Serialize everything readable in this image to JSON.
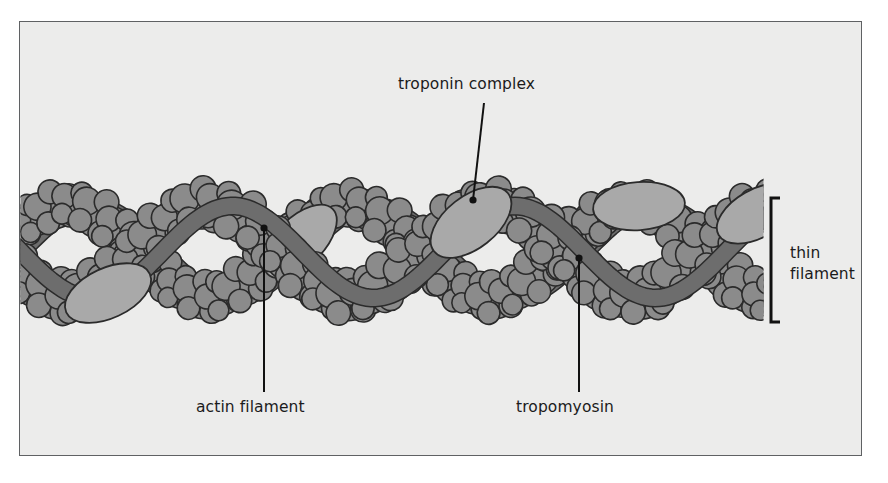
{
  "figure": {
    "kind": "biology-diagram",
    "background_color": "#ececeb",
    "frame_border_color": "#5f6163"
  },
  "palette": {
    "actin_fill": "#8b8b8b",
    "tropomyosin_fill": "#6d6d6d",
    "troponin_fill": "#a9a9a9",
    "outline": "#2b2b2b",
    "label_text": "#1b1b1b",
    "leader_line": "#111111"
  },
  "labels": {
    "troponin": "troponin complex",
    "actin": "actin filament",
    "tropomyosin": "tropomyosin",
    "thin_filament_line1": "thin",
    "thin_filament_line2": "filament"
  },
  "annotations": [
    {
      "name": "troponin-complex",
      "text": "troponin complex",
      "leader": {
        "x1": 484,
        "y1": 103,
        "x2": 473,
        "y2": 200
      },
      "dot_at": "end"
    },
    {
      "name": "actin-filament",
      "text": "actin filament",
      "leader": {
        "x1": 264,
        "y1": 228,
        "x2": 264,
        "y2": 392
      },
      "dot_at": "start"
    },
    {
      "name": "tropomyosin",
      "text": "tropomyosin",
      "leader": {
        "x1": 579,
        "y1": 258,
        "x2": 579,
        "y2": 392
      },
      "dot_at": "start"
    },
    {
      "name": "thin-filament-bracket",
      "text": "thin filament",
      "bracket": {
        "x": 771,
        "y_top": 198,
        "y_bottom": 322,
        "tick": 9
      }
    }
  ],
  "structure": {
    "description": "Actin double helix with two tropomyosin strands and periodic troponin complexes",
    "filament_left": 21,
    "filament_right": 763,
    "axis_y": 252,
    "helix_period": 282,
    "helix_amplitude": 46,
    "actin_monomer_count": 38,
    "troponin_count": 5,
    "troponin_positions_x": [
      108,
      471,
      300,
      639,
      760
    ],
    "tropomyosin_strand_count": 2
  },
  "chart_data": {
    "type": "diagram",
    "components": [
      {
        "name": "actin filament",
        "role": "globular monomers forming a double helix",
        "color": "#8b8b8b"
      },
      {
        "name": "tropomyosin",
        "role": "coiled-coil strands lying in the helical grooves",
        "color": "#6d6d6d"
      },
      {
        "name": "troponin complex",
        "role": "regulatory complex spaced along tropomyosin",
        "color": "#a9a9a9"
      }
    ]
  }
}
